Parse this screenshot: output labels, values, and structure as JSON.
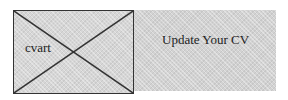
{
  "image": {
    "alt_text": "cvart",
    "icon": "broken-image-placeholder-icon"
  },
  "link": {
    "label": "Update Your CV"
  },
  "colors": {
    "panel_bg": "#d2d2d2",
    "border": "#333333",
    "text": "#222222"
  }
}
